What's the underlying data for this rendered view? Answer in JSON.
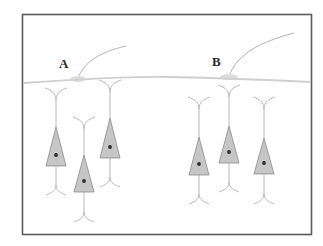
{
  "diagram": {
    "type": "neuron-schematic",
    "frame": {
      "border_color": "#5a5a5a",
      "background": "#ffffff"
    },
    "colors": {
      "axon": "#cfcfcf",
      "synapse": "#dcdcdc",
      "input_fiber": "#a8a8a8",
      "soma_fill": "#c6c6c6",
      "soma_stroke": "#8a8a8a",
      "dendrite": "#b0b0b0",
      "nucleus": "#2b2b2b"
    },
    "sites": [
      {
        "label": "A",
        "x": 64,
        "y": 65,
        "synapse_x": 78,
        "synapse_y": 79
      },
      {
        "label": "B",
        "x": 217,
        "y": 63,
        "synapse_x": 229,
        "synapse_y": 77
      }
    ],
    "neurons": [
      {
        "group": "A",
        "cx": 56,
        "apex": 127,
        "base": 166,
        "top": 88,
        "bottom": 195
      },
      {
        "group": "A",
        "cx": 84,
        "apex": 155,
        "base": 192,
        "top": 117,
        "bottom": 222
      },
      {
        "group": "A",
        "cx": 110,
        "apex": 118,
        "base": 158,
        "top": 80,
        "bottom": 187
      },
      {
        "group": "B",
        "cx": 199,
        "apex": 137,
        "base": 175,
        "top": 97,
        "bottom": 204
      },
      {
        "group": "B",
        "cx": 229,
        "apex": 126,
        "base": 163,
        "top": 85,
        "bottom": 192
      },
      {
        "group": "B",
        "cx": 264,
        "apex": 138,
        "base": 174,
        "top": 97,
        "bottom": 204
      }
    ]
  }
}
